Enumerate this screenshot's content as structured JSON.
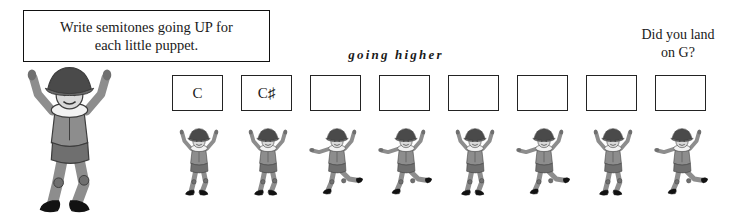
{
  "page": {
    "background_color": "#ffffff",
    "ink_color": "#1a1a1a"
  },
  "instruction": {
    "text": "Write semitones going UP for\neach little puppet."
  },
  "captions": {
    "going_higher": "going higher",
    "landing_question": "Did you land\non G?"
  },
  "answer_boxes": {
    "count": 8,
    "values": [
      "C",
      "C♯",
      "",
      "",
      "",
      "",
      "",
      ""
    ],
    "positions_x": [
      172,
      241,
      310,
      379,
      448,
      517,
      586,
      655
    ],
    "position_y": 75
  },
  "puppets": {
    "large": {
      "name": "big-puppet",
      "pose": "arms-up-kick",
      "x": 2,
      "y": 58,
      "width": 135,
      "height": 155
    },
    "small": [
      {
        "pose": "arms-up",
        "x": 171,
        "y": 108
      },
      {
        "pose": "arms-up",
        "x": 240,
        "y": 108
      },
      {
        "pose": "one-arm-out",
        "x": 309,
        "y": 108
      },
      {
        "pose": "one-arm-out",
        "x": 378,
        "y": 108
      },
      {
        "pose": "arms-up",
        "x": 447,
        "y": 108
      },
      {
        "pose": "one-arm-out",
        "x": 516,
        "y": 108
      },
      {
        "pose": "arms-up",
        "x": 585,
        "y": 108
      },
      {
        "pose": "one-arm-out",
        "x": 654,
        "y": 108
      }
    ],
    "colors": {
      "body": "#8d8d8d",
      "body_shade": "#6f6f6f",
      "hat": "#4a4a4a",
      "hat_light": "#6a6a6a",
      "boot": "#121212",
      "face": "#d8d8d8",
      "collar": "#f2f2f2",
      "outline": "#3d3d3d"
    }
  }
}
